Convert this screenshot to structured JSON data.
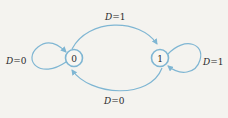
{
  "diagram": {
    "type": "state-diagram",
    "colors": {
      "edge": "#7fb6d3",
      "node": "#7fb6d3",
      "text": "#2a2a2a",
      "background": "#f4f3ef"
    },
    "nodes": [
      {
        "id": "0",
        "label": "0"
      },
      {
        "id": "1",
        "label": "1"
      }
    ],
    "edges": [
      {
        "from": "0",
        "to": "0",
        "var": "D",
        "eq": "=0",
        "label": "D=0"
      },
      {
        "from": "0",
        "to": "1",
        "var": "D",
        "eq": "=1",
        "label": "D=1"
      },
      {
        "from": "1",
        "to": "1",
        "var": "D",
        "eq": "=1",
        "label": "D=1"
      },
      {
        "from": "1",
        "to": "0",
        "var": "D",
        "eq": "=0",
        "label": "D=0"
      }
    ]
  }
}
